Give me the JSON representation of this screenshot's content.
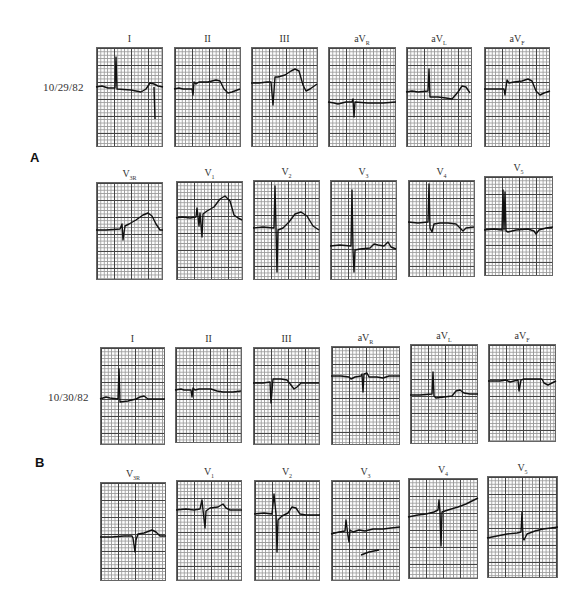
{
  "figure": {
    "panels": [
      {
        "id": "A",
        "label": "A",
        "date": "10/29/82",
        "rows": [
          {
            "type": "limb",
            "leads": [
              {
                "name": "I",
                "base": "I",
                "sub": ""
              },
              {
                "name": "II",
                "base": "II",
                "sub": ""
              },
              {
                "name": "III",
                "base": "III",
                "sub": ""
              },
              {
                "name": "aVR",
                "base": "aV",
                "sub": "R"
              },
              {
                "name": "aVL",
                "base": "aV",
                "sub": "L"
              },
              {
                "name": "aVF",
                "base": "aV",
                "sub": "F"
              }
            ]
          },
          {
            "type": "precordial",
            "leads": [
              {
                "name": "V3R",
                "base": "V",
                "sub": "3R"
              },
              {
                "name": "V1",
                "base": "V",
                "sub": "1"
              },
              {
                "name": "V2",
                "base": "V",
                "sub": "2"
              },
              {
                "name": "V3",
                "base": "V",
                "sub": "3"
              },
              {
                "name": "V4",
                "base": "V",
                "sub": "4"
              },
              {
                "name": "V5",
                "base": "V",
                "sub": "5"
              }
            ]
          }
        ]
      },
      {
        "id": "B",
        "label": "B",
        "date": "10/30/82",
        "rows": [
          {
            "type": "limb",
            "leads": [
              {
                "name": "I",
                "base": "I",
                "sub": ""
              },
              {
                "name": "II",
                "base": "II",
                "sub": ""
              },
              {
                "name": "III",
                "base": "III",
                "sub": ""
              },
              {
                "name": "aVR",
                "base": "aV",
                "sub": "R"
              },
              {
                "name": "aVL",
                "base": "aV",
                "sub": "L"
              },
              {
                "name": "aVF",
                "base": "aV",
                "sub": "F"
              }
            ]
          },
          {
            "type": "precordial",
            "leads": [
              {
                "name": "V3R",
                "base": "V",
                "sub": "3R"
              },
              {
                "name": "V1",
                "base": "V",
                "sub": "1"
              },
              {
                "name": "V2",
                "base": "V",
                "sub": "2"
              },
              {
                "name": "V3",
                "base": "V",
                "sub": "3"
              },
              {
                "name": "V4",
                "base": "V",
                "sub": "4"
              },
              {
                "name": "V5",
                "base": "V",
                "sub": "5"
              }
            ]
          }
        ]
      }
    ]
  }
}
